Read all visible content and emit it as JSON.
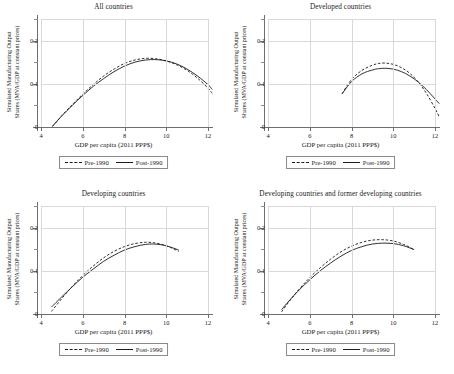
{
  "figure": {
    "xlabel": "GDP per capita (2011 PPP$)",
    "ylabel_line1": "Simulated Manufacturing Output",
    "ylabel_line2": "Shares (MVA/GDP at constant prices)",
    "legend": {
      "pre_label": "Pre-1990",
      "post_label": "Post-1990"
    },
    "xticks": [
      "4",
      "6",
      "8",
      "10",
      "12"
    ],
    "yticks": [
      "0",
      "0.1",
      "0.2"
    ]
  },
  "chart_data": {
    "type": "line",
    "xlabel": "GDP per capita (2011 PPP$)",
    "ylabel": "Simulated Manufacturing Output Shares (MVA/GDP at constant prices)",
    "xlim": [
      4,
      12
    ],
    "ylim": [
      0,
      0.25
    ],
    "xticks": [
      4,
      6,
      8,
      10,
      12
    ],
    "yticks": [
      0,
      0.1,
      0.2
    ],
    "grid": true,
    "legend_position": "below-panel",
    "panels": [
      {
        "title": "All countries",
        "series": [
          {
            "name": "Pre-1990",
            "style": "dashed",
            "x": [
              4.55,
              5.0,
              5.5,
              6.0,
              6.5,
              7.0,
              7.5,
              8.0,
              8.5,
              9.0,
              9.5,
              10.0,
              10.5,
              11.0,
              11.5,
              12.0,
              12.2
            ],
            "y": [
              0.001,
              0.026,
              0.052,
              0.076,
              0.098,
              0.118,
              0.134,
              0.147,
              0.155,
              0.159,
              0.158,
              0.153,
              0.144,
              0.131,
              0.113,
              0.09,
              0.078
            ]
          },
          {
            "name": "Post-1990",
            "style": "solid",
            "x": [
              4.55,
              5.0,
              5.5,
              6.0,
              6.5,
              7.0,
              7.5,
              8.0,
              8.5,
              9.0,
              9.5,
              10.0,
              10.5,
              11.0,
              11.5,
              12.0,
              12.2
            ],
            "y": [
              0.002,
              0.026,
              0.05,
              0.073,
              0.094,
              0.112,
              0.128,
              0.141,
              0.15,
              0.155,
              0.156,
              0.153,
              0.146,
              0.134,
              0.118,
              0.098,
              0.087
            ]
          }
        ]
      },
      {
        "title": "Developed countries",
        "series": [
          {
            "name": "Pre-1990",
            "style": "dashed",
            "x": [
              7.55,
              8.0,
              8.5,
              9.0,
              9.3,
              9.6,
              10.0,
              10.4,
              10.8,
              11.2,
              11.6,
              12.0,
              12.2
            ],
            "y": [
              0.077,
              0.11,
              0.131,
              0.143,
              0.147,
              0.148,
              0.145,
              0.137,
              0.124,
              0.104,
              0.077,
              0.043,
              0.024
            ]
          },
          {
            "name": "Post-1990",
            "style": "solid",
            "x": [
              7.55,
              8.0,
              8.5,
              9.0,
              9.3,
              9.6,
              10.0,
              10.4,
              10.8,
              11.2,
              11.6,
              12.0,
              12.2
            ],
            "y": [
              0.077,
              0.105,
              0.123,
              0.132,
              0.135,
              0.136,
              0.134,
              0.128,
              0.118,
              0.104,
              0.086,
              0.065,
              0.054
            ]
          }
        ]
      },
      {
        "title": "Developing countries",
        "series": [
          {
            "name": "Pre-1990",
            "style": "dashed",
            "x": [
              4.5,
              5.0,
              5.5,
              6.0,
              6.5,
              7.0,
              7.5,
              8.0,
              8.5,
              9.0,
              9.4,
              9.8,
              10.2,
              10.6
            ],
            "y": [
              0.006,
              0.036,
              0.064,
              0.089,
              0.111,
              0.13,
              0.145,
              0.156,
              0.163,
              0.166,
              0.165,
              0.161,
              0.154,
              0.145
            ]
          },
          {
            "name": "Post-1990",
            "style": "solid",
            "x": [
              4.5,
              5.0,
              5.5,
              6.0,
              6.5,
              7.0,
              7.5,
              8.0,
              8.5,
              9.0,
              9.4,
              9.8,
              10.2,
              10.6
            ],
            "y": [
              0.016,
              0.04,
              0.063,
              0.085,
              0.104,
              0.122,
              0.136,
              0.148,
              0.156,
              0.161,
              0.162,
              0.16,
              0.155,
              0.148
            ]
          }
        ]
      },
      {
        "title": "Developing countries and former developing countries",
        "series": [
          {
            "name": "Pre-1990",
            "style": "dashed",
            "x": [
              4.65,
              5.0,
              5.5,
              6.0,
              6.5,
              7.0,
              7.5,
              8.0,
              8.5,
              9.0,
              9.5,
              10.0,
              10.5,
              11.0
            ],
            "y": [
              0.005,
              0.028,
              0.058,
              0.084,
              0.107,
              0.127,
              0.144,
              0.157,
              0.166,
              0.171,
              0.172,
              0.169,
              0.161,
              0.149
            ]
          },
          {
            "name": "Post-1990",
            "style": "solid",
            "x": [
              4.65,
              5.0,
              5.5,
              6.0,
              6.5,
              7.0,
              7.5,
              8.0,
              8.5,
              9.0,
              9.5,
              10.0,
              10.5,
              11.0
            ],
            "y": [
              0.01,
              0.03,
              0.056,
              0.079,
              0.1,
              0.118,
              0.134,
              0.147,
              0.156,
              0.162,
              0.164,
              0.163,
              0.158,
              0.149
            ]
          }
        ]
      }
    ]
  }
}
